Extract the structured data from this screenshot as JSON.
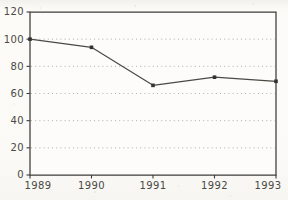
{
  "chart_data": {
    "type": "line",
    "title": "",
    "subtitle": "",
    "xlabel": "",
    "ylabel": "",
    "categories": [
      "1989",
      "1990",
      "1991",
      "1992",
      "1993"
    ],
    "x": [
      1989,
      1990,
      1991,
      1992,
      1993
    ],
    "values": [
      100,
      94,
      66,
      72,
      69
    ],
    "series": [
      {
        "name": "",
        "values": [
          100,
          94,
          66,
          72,
          69
        ]
      }
    ],
    "ylim": [
      0,
      120
    ],
    "yticks": [
      0,
      20,
      40,
      60,
      80,
      100,
      120
    ],
    "ytick_labels": [
      "0",
      "20",
      "40",
      "60",
      "80",
      "100",
      "120"
    ],
    "xticks": [
      1989,
      1990,
      1991,
      1992,
      1993
    ],
    "xtick_labels": [
      "1989",
      "1990",
      "1991",
      "1992",
      "1993"
    ],
    "grid": "horizontal-dotted",
    "gridlines_at": [
      20,
      40,
      60,
      80,
      100
    ],
    "legend": "none",
    "legend_position": "",
    "marker": "square",
    "annotations": []
  },
  "style": {
    "line_color": "#4a4944",
    "marker_color": "#33322e",
    "grid_color": "#8d8c86",
    "axis_color": "#3d3c38",
    "label_color": "#4a4944",
    "page_color": "#fbfaf7",
    "plot_background": "#fdfcfa"
  },
  "axis_labels": {
    "y": [
      "120",
      "100",
      "80",
      "60",
      "40",
      "20",
      "0"
    ],
    "x": [
      "1989",
      "1990",
      "1991",
      "1992",
      "1993"
    ]
  }
}
